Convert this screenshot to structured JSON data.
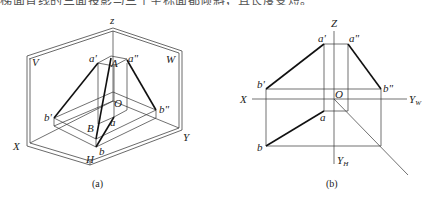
{
  "header": {
    "partial_text": "梯面直线的三面投影与三个坐标面都倾斜，且长度变短。"
  },
  "figure_a": {
    "caption": "(a)",
    "labels": {
      "z": "z",
      "V": "V",
      "W": "W",
      "a_prime": "a'",
      "a_double_prime": "a\"",
      "A": "A",
      "O": "O",
      "b_prime": "b'",
      "b_double_prime": "b\"",
      "a": "a",
      "B": "B",
      "b": "b",
      "X": "X",
      "Y": "Y",
      "H": "H"
    }
  },
  "figure_b": {
    "caption": "(b)",
    "labels": {
      "Z": "Z",
      "a_prime": "a'",
      "a_double_prime": "a\"",
      "b_prime": "b'",
      "b_double_prime": "b\"",
      "X": "X",
      "O": "O",
      "Y_W": "Y",
      "Y_W_sub": "W",
      "a": "a",
      "b": "b",
      "Y_H": "Y",
      "Y_H_sub": "H"
    }
  }
}
